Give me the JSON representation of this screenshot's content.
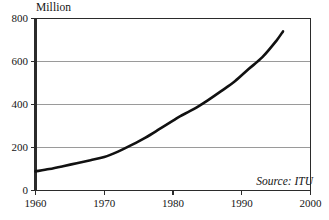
{
  "chart_data": {
    "type": "line",
    "title": "",
    "subtitle": "",
    "xlabel": "",
    "ylabel": "Million",
    "unit_label": "Million",
    "xlim": [
      1960,
      2000
    ],
    "ylim": [
      0,
      800
    ],
    "grid": "horizontal",
    "legend": "none",
    "annotation": "Source: ITU",
    "source": "Source: ITU",
    "line_color": "#111111",
    "grid_color": "#9a9a9a",
    "frame_color": "#2b2b2b",
    "background_color": "#ffffff",
    "xticks": [
      1960,
      1970,
      1980,
      1990,
      2000
    ],
    "xtick_labels": [
      "1960",
      "1970",
      "1980",
      "1990",
      "2000"
    ],
    "yticks": [
      0,
      200,
      400,
      600,
      800
    ],
    "ytick_labels": [
      "0",
      "200",
      "400",
      "600",
      "800"
    ],
    "series": [
      {
        "name": "Telephone main lines",
        "x": [
          1960,
          1962,
          1964,
          1966,
          1968,
          1970,
          1972,
          1974,
          1976,
          1978,
          1980,
          1981,
          1983,
          1985,
          1987,
          1989,
          1991,
          1993,
          1995,
          1996
        ],
        "values": [
          89,
          100,
          113,
          127,
          141,
          156,
          181,
          212,
          246,
          285,
          325,
          345,
          378,
          418,
          462,
          508,
          565,
          620,
          695,
          740
        ]
      }
    ]
  }
}
